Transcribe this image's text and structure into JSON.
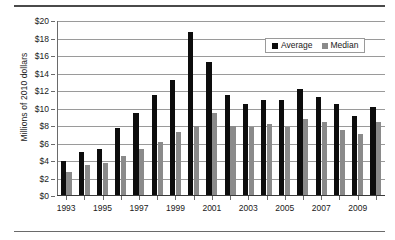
{
  "chart_data": {
    "type": "bar",
    "title": "",
    "xlabel": "",
    "ylabel": "Millions of 2010 dollars",
    "ylim": [
      0,
      20
    ],
    "ytick_labels": [
      "$0",
      "$2",
      "$4",
      "$6",
      "$8",
      "$10",
      "$12",
      "$14",
      "$16",
      "$18",
      "$20"
    ],
    "ytick_values": [
      0,
      2,
      4,
      6,
      8,
      10,
      12,
      14,
      16,
      18,
      20
    ],
    "ytick_prefix": "$",
    "grid": true,
    "legend_position": "top-right",
    "categories": [
      1993,
      1994,
      1995,
      1996,
      1997,
      1998,
      1999,
      2000,
      2001,
      2002,
      2003,
      2004,
      2005,
      2006,
      2007,
      2008,
      2009,
      2010
    ],
    "xtick_labels": [
      "1993",
      "1995",
      "1997",
      "1999",
      "2001",
      "2003",
      "2005",
      "2007",
      "2009"
    ],
    "xtick_values": [
      1993,
      1995,
      1997,
      1999,
      2001,
      2003,
      2005,
      2007,
      2009
    ],
    "series": [
      {
        "name": "Average",
        "color": "#0d0d0d",
        "values": [
          4.0,
          5.0,
          5.4,
          7.8,
          9.5,
          11.6,
          13.3,
          18.8,
          15.3,
          11.6,
          10.5,
          11.0,
          11.0,
          12.2,
          11.3,
          10.5,
          9.2,
          10.2
        ]
      },
      {
        "name": "Median",
        "color": "#8a8a8a",
        "values": [
          2.8,
          3.6,
          3.8,
          4.6,
          5.4,
          6.2,
          7.3,
          8.0,
          9.5,
          8.0,
          7.9,
          8.2,
          7.9,
          8.8,
          8.5,
          7.6,
          7.1,
          8.5
        ]
      }
    ]
  },
  "legend": {
    "items": [
      {
        "label": "Average",
        "color": "#0d0d0d"
      },
      {
        "label": "Median",
        "color": "#8a8a8a"
      }
    ]
  }
}
